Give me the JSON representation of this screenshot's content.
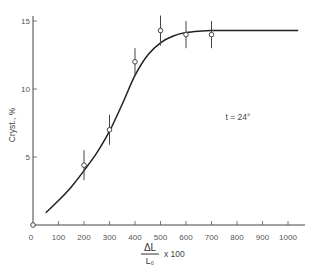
{
  "chart_data": {
    "type": "scatter",
    "title": "",
    "xlabel": {
      "numerator": "ΔL",
      "denominator": "L₀",
      "multiplier": "x 100"
    },
    "ylabel": "Cryst., %",
    "xlim": [
      0,
      1050
    ],
    "ylim": [
      0,
      15.5
    ],
    "xticks": [
      0,
      100,
      200,
      300,
      400,
      500,
      600,
      700,
      800,
      900,
      1000
    ],
    "xtick_labels": [
      "0",
      "100",
      "200",
      "300",
      "400",
      "500",
      "600",
      "700",
      "800",
      "900",
      "1000"
    ],
    "yticks": [
      5,
      10,
      15
    ],
    "ytick_labels": [
      "5",
      "10",
      "15"
    ],
    "y_origin_label": "0",
    "grid": false,
    "annotation": "t = 24°",
    "series": [
      {
        "name": "measured",
        "marker": "open-circle",
        "points": [
          {
            "x": 0,
            "y": 0,
            "err": 0
          },
          {
            "x": 200,
            "y": 4.4,
            "err": 1.1
          },
          {
            "x": 300,
            "y": 7.0,
            "err": 1.1
          },
          {
            "x": 400,
            "y": 12.0,
            "err": 1.0
          },
          {
            "x": 500,
            "y": 14.3,
            "err": 1.1
          },
          {
            "x": 600,
            "y": 14.0,
            "err": 1.0
          },
          {
            "x": 700,
            "y": 14.0,
            "err": 1.0
          }
        ]
      },
      {
        "name": "fitted-curve",
        "type": "line",
        "points": [
          {
            "x": 50,
            "y": 0.9
          },
          {
            "x": 100,
            "y": 1.8
          },
          {
            "x": 150,
            "y": 2.8
          },
          {
            "x": 200,
            "y": 4.0
          },
          {
            "x": 250,
            "y": 5.3
          },
          {
            "x": 300,
            "y": 6.9
          },
          {
            "x": 350,
            "y": 8.9
          },
          {
            "x": 400,
            "y": 11.0
          },
          {
            "x": 450,
            "y": 12.5
          },
          {
            "x": 500,
            "y": 13.4
          },
          {
            "x": 550,
            "y": 13.9
          },
          {
            "x": 600,
            "y": 14.15
          },
          {
            "x": 650,
            "y": 14.25
          },
          {
            "x": 700,
            "y": 14.3
          },
          {
            "x": 800,
            "y": 14.3
          },
          {
            "x": 900,
            "y": 14.3
          },
          {
            "x": 1040,
            "y": 14.3
          }
        ]
      }
    ]
  }
}
